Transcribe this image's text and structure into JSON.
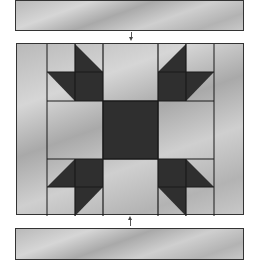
{
  "diagram": {
    "pieces": [
      {
        "name": "top-border-strip",
        "role": "border strip"
      },
      {
        "name": "center-block",
        "role": "star/bear-paw style block with side borders"
      },
      {
        "name": "bottom-border-strip",
        "role": "border strip"
      }
    ],
    "arrows": [
      {
        "direction": "down",
        "from": "top-border-strip",
        "to": "center-block"
      },
      {
        "direction": "up",
        "from": "bottom-border-strip",
        "to": "center-block"
      }
    ],
    "colors": {
      "light_fabric": "#c2c2c2",
      "dark_fabric": "#2f2f2f",
      "seam": "#1a1a1a",
      "background": "#ffffff"
    }
  }
}
